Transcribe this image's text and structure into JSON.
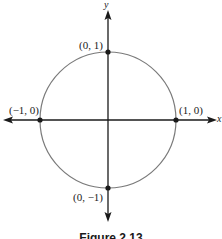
{
  "figure": {
    "caption": "Figure 2.13",
    "axes": {
      "x_label": "x",
      "y_label": "y"
    },
    "circle": {
      "center": [
        0,
        0
      ],
      "radius": 1,
      "stroke_color": "#7a7a7a"
    },
    "points": [
      {
        "label": "(0, 1)",
        "x": 0,
        "y": 1
      },
      {
        "label": "(-1, 0)",
        "display": "(−1, 0)",
        "x": -1,
        "y": 0
      },
      {
        "label": "(1, 0)",
        "x": 1,
        "y": 0
      },
      {
        "label": "(0, -1)",
        "display": "(0, −1)",
        "x": 0,
        "y": -1
      }
    ],
    "colors": {
      "axis": "#1a1a1a",
      "point": "#1a1a1a",
      "background": "#ffffff"
    }
  },
  "labels": {
    "top": "(0, 1)",
    "left": "(−1, 0)",
    "right": "(1, 0)",
    "bottom": "(0, −1)",
    "x_axis": "x",
    "y_axis": "y"
  }
}
